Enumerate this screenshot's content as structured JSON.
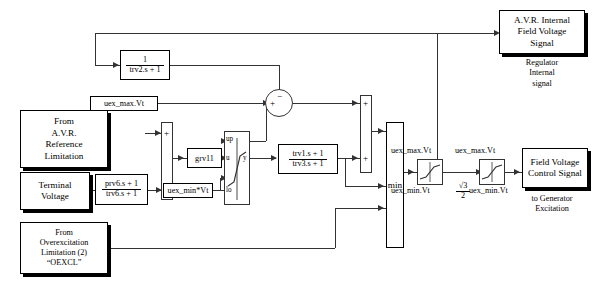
{
  "diagram": {
    "sources": {
      "avr_reference": "From\nA.V.R.\nReference\nLimitation",
      "terminal_voltage": "Terminal\nVoltage",
      "overexcitation": "From\nOverexcitation\nLimitation (2)\n“OEXCL”"
    },
    "sinks": {
      "avr_internal": "A.V.R. Internal\nField Voltage\nSignal",
      "avr_internal_caption": "Regulator\nInternal\nsignal",
      "field_voltage_control": "Field Voltage\nControl Signal",
      "field_voltage_caption": "to Generator\nExcitation"
    },
    "transfer_functions": {
      "trv2": {
        "num": "1",
        "den": "trv2.s + 1"
      },
      "prv6_trv6": {
        "num": "prv6.s + 1",
        "den": "trv6.s + 1"
      },
      "trv1_trv3": {
        "num": "trv1.s + 1",
        "den": "trv3.s + 1"
      }
    },
    "gain": {
      "grv11": "grv11"
    },
    "limits": {
      "uex_max_vt_top": "uex_max.Vt",
      "uex_min_vt_mid": "uex_min*Vt",
      "sat1_max": "uex_max.Vt",
      "sat1_min": "uex_min.Vt",
      "sat2_max": "uex_max.Vt",
      "sat2_min": "uex_min.Vt"
    },
    "sqrt_factor": {
      "num": "√3",
      "den": "2"
    },
    "sum_signs": {
      "circle_plus": "+",
      "circle_minus": "−",
      "bar1_plus": "+",
      "bar1_minus": "−",
      "bar2_plus_top": "+",
      "bar2_plus_bottom": "+"
    },
    "saturation_ports": {
      "up": "up",
      "u": "u",
      "lo": "lo",
      "y": "y"
    },
    "min_block": {
      "label": "min"
    }
  }
}
